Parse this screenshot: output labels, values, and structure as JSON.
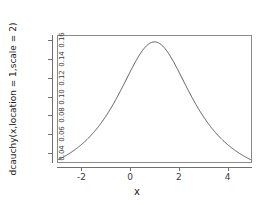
{
  "chart_data": {
    "type": "line",
    "title": "",
    "xlabel": "x",
    "ylabel": "dcauchy(x,location = 1,scale = 2)",
    "xlim": [
      -3,
      5
    ],
    "ylim": [
      0.0295,
      0.1655
    ],
    "xticks": [
      "-2",
      "0",
      "2",
      "4"
    ],
    "xtick_values": [
      -2,
      0,
      2,
      4
    ],
    "yticks": [
      "0.04",
      "0.06",
      "0.08",
      "0.10",
      "0.12",
      "0.14",
      "0.16"
    ],
    "ytick_values": [
      0.04,
      0.06,
      0.08,
      0.1,
      0.12,
      0.14,
      0.16
    ],
    "grid": false,
    "legend": false,
    "box": true,
    "series": [
      {
        "name": "dcauchy(x, location = 1, scale = 2)",
        "color": "#555555",
        "distribution": "cauchy",
        "location": 1,
        "scale": 2,
        "x": [
          -3.0,
          -2.8,
          -2.6,
          -2.4,
          -2.2,
          -2.0,
          -1.8,
          -1.6,
          -1.4,
          -1.2,
          -1.0,
          -0.8,
          -0.6,
          -0.4,
          -0.2,
          0.0,
          0.2,
          0.4,
          0.6,
          0.8,
          1.0,
          1.2,
          1.4,
          1.6,
          1.8,
          2.0,
          2.2,
          2.4,
          2.6,
          2.8,
          3.0,
          3.2,
          3.4,
          3.6,
          3.8,
          4.0,
          4.2,
          4.4,
          4.6,
          4.8,
          5.0
        ],
        "y": [
          0.0306,
          0.0334,
          0.0365,
          0.0399,
          0.0437,
          0.0477,
          0.0521,
          0.0568,
          0.0618,
          0.067,
          0.0724,
          0.0779,
          0.0834,
          0.0888,
          0.0939,
          0.0987,
          0.108,
          0.1118,
          0.119,
          0.1245,
          0.1592,
          0.1584,
          0.1561,
          0.1524,
          0.1474,
          0.1415,
          0.1348,
          0.1276,
          0.1202,
          0.1127,
          0.1053,
          0.0981,
          0.0913,
          0.0849,
          0.0789,
          0.0733,
          0.0681,
          0.0633,
          0.0588,
          0.0547,
          0.0509
        ]
      }
    ]
  },
  "axes": {
    "x_title": "x",
    "y_title": "dcauchy(x,location = 1,scale = 2)"
  },
  "colors": {
    "curve": "#555555",
    "axis": "#6f6f6f",
    "box": "#8a8a8a",
    "background": "#ffffff",
    "text": "#333333"
  }
}
